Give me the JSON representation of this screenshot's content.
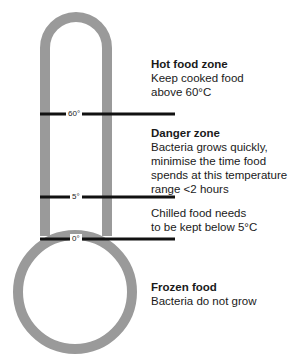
{
  "diagram": {
    "type": "thermometer",
    "colors": {
      "outline": "#9a9a9a",
      "tick_line": "#111111",
      "text": "#1a1a1a"
    },
    "ticks": [
      {
        "label": "60°",
        "value": 60
      },
      {
        "label": "5°",
        "value": 5
      },
      {
        "label": "0°",
        "value": 0
      }
    ],
    "zones": [
      {
        "title": "Hot food zone",
        "description": "Keep cooked food\nabove 60°C"
      },
      {
        "title": "Danger zone",
        "description": "Bacteria grows quickly,\nminimise the time food\nspends at this temperature\nrange <2 hours"
      },
      {
        "title": "",
        "description": "Chilled food needs\nto be kept below 5°C"
      },
      {
        "title": "Frozen food",
        "description": "Bacteria do not grow"
      }
    ]
  }
}
